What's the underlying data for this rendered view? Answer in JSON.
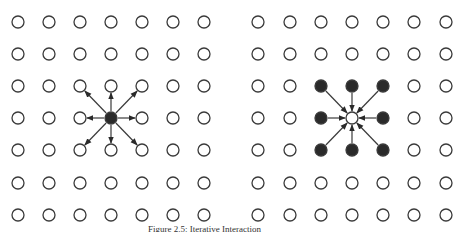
{
  "diagram": {
    "grid": {
      "rows": 7,
      "cols": 7,
      "row_y": [
        22,
        54,
        86,
        118,
        150,
        183,
        215
      ],
      "left_col_x": [
        18,
        49,
        80,
        111,
        142,
        173,
        204
      ],
      "right_col_x": [
        258,
        290,
        321,
        352,
        383,
        414,
        446
      ],
      "node_radius": 6
    },
    "left_panel": {
      "description": "Central filled node sends arrows outward to 8 neighbors",
      "center": {
        "row": 3,
        "col": 3,
        "filled": true
      },
      "arrow_direction": "outward"
    },
    "right_panel": {
      "description": "8 filled neighbors send arrows inward to central open node",
      "center": {
        "row": 3,
        "col": 3,
        "filled": false
      },
      "filled_neighbors": true,
      "arrow_direction": "inward"
    },
    "colors": {
      "stroke": "#3a3a3a",
      "fill_dark": "#2a2a2a",
      "background": "#ffffff"
    },
    "caption": "Figure 2.5: Iterative Interaction"
  }
}
